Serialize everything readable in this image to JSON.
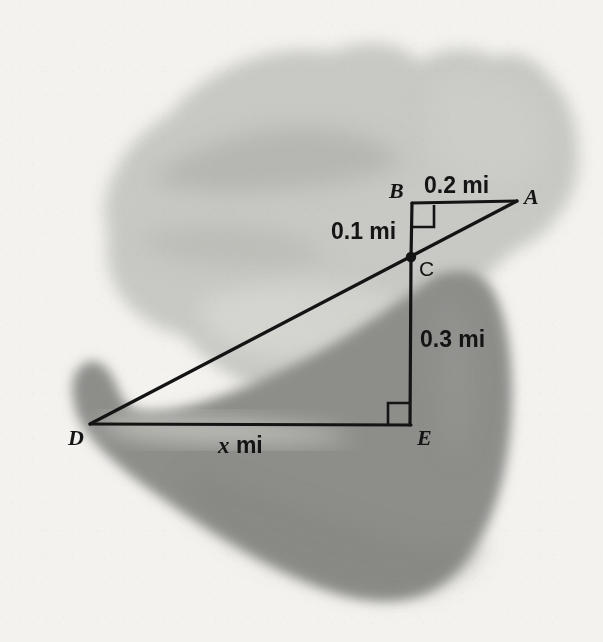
{
  "figure": {
    "kind": "geometry-diagram",
    "background_color": "#f3f2ef",
    "line_color": "#141414",
    "light_region_color": "#c9c9c5",
    "dark_region_color": "#8f8f8c"
  },
  "points": [
    {
      "id": "A",
      "label": "A",
      "x": 517,
      "y": 201,
      "label_x": 524,
      "label_y": 186,
      "style": "italic-serif"
    },
    {
      "id": "B",
      "label": "B",
      "x": 412,
      "y": 203,
      "label_x": 389,
      "label_y": 180,
      "style": "italic-serif"
    },
    {
      "id": "C",
      "label": "C",
      "x": 411,
      "y": 257,
      "label_x": 419,
      "label_y": 258,
      "style": "sans"
    },
    {
      "id": "D",
      "label": "D",
      "x": 90,
      "y": 424,
      "label_x": 68,
      "label_y": 427,
      "style": "italic-serif"
    },
    {
      "id": "E",
      "label": "E",
      "x": 410,
      "y": 424,
      "label_x": 417,
      "label_y": 427,
      "style": "italic-serif"
    }
  ],
  "segments": [
    {
      "id": "BA",
      "from": "B",
      "to": "A",
      "name": "segment-b-a"
    },
    {
      "id": "BC",
      "from": "B",
      "to": "C",
      "name": "segment-b-c"
    },
    {
      "id": "DA",
      "from": "D",
      "to": "A",
      "name": "segment-d-a-hypotenuse"
    },
    {
      "id": "DE",
      "from": "D",
      "to": "E",
      "name": "segment-d-e"
    },
    {
      "id": "CE",
      "from": "C",
      "to": "E",
      "name": "segment-c-e"
    }
  ],
  "measurements": [
    {
      "id": "ba",
      "text": "0.2 mi",
      "value": 0.2,
      "unit": "mi",
      "for_segment": "BA",
      "x": 424,
      "y": 174
    },
    {
      "id": "bc",
      "text": "0.1 mi",
      "value": 0.1,
      "unit": "mi",
      "for_segment": "BC",
      "x": 331,
      "y": 220
    },
    {
      "id": "ce",
      "text": "0.3 mi",
      "value": 0.3,
      "unit": "mi",
      "for_segment": "CE",
      "x": 420,
      "y": 328
    },
    {
      "id": "de",
      "text": "x mi",
      "value": "x",
      "unit": "mi",
      "for_segment": "DE",
      "x": 218,
      "y": 434,
      "italic_prefix": "x",
      "rest": " mi"
    }
  ],
  "right_angles": [
    {
      "id": "angle-b",
      "vertex": "B",
      "name": "right-angle-marker-b",
      "size": 22
    },
    {
      "id": "angle-e",
      "vertex": "E",
      "name": "right-angle-marker-e",
      "size": 22
    }
  ],
  "vertex_dots": [
    {
      "id": "dot-c",
      "for_point": "C",
      "radius": 5
    }
  ]
}
